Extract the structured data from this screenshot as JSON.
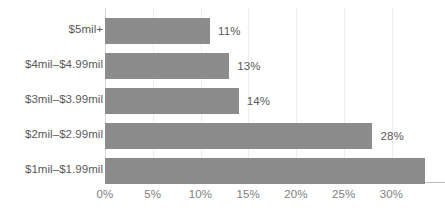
{
  "chart_data": {
    "type": "bar",
    "orientation": "horizontal",
    "title": "",
    "subtitle": "",
    "xlabel": "",
    "ylabel": "",
    "categories": [
      "$5mil+",
      "$4mil–$4.99mil",
      "$3mil–$3.99mil",
      "$2mil–$2.99mil",
      "$1mil–$1.99mil"
    ],
    "values": [
      11,
      13,
      14,
      28,
      33.5
    ],
    "data_labels": [
      "11%",
      "13%",
      "14%",
      "28%",
      ""
    ],
    "xlim": [
      0,
      33.5
    ],
    "xticks": [
      0,
      5,
      10,
      15,
      20,
      25,
      30
    ],
    "xtick_labels": [
      "0%",
      "5%",
      "10%",
      "15%",
      "20%",
      "25%",
      "30%"
    ],
    "grid": true,
    "grid_axis": "x",
    "legend": false,
    "legend_position": "none",
    "bar_color": "#8c8c8c",
    "gridline_color": "#ededed",
    "axis_line_color": "#bfbfbf",
    "label_color": "#595959",
    "tick_color": "#808080"
  }
}
